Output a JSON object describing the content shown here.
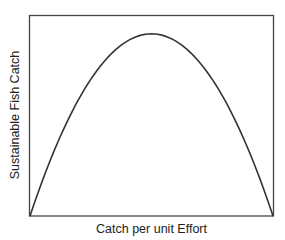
{
  "chart_data": {
    "type": "line",
    "title": "",
    "xlabel": "Catch per unit Effort",
    "ylabel": "Sustainable Fish Catch",
    "x": [
      0,
      0.1,
      0.2,
      0.3,
      0.4,
      0.5,
      0.6,
      0.7,
      0.8,
      0.9,
      1.0
    ],
    "series": [
      {
        "name": "Sustainable catch curve",
        "values": [
          0,
          0.36,
          0.64,
          0.84,
          0.96,
          1.0,
          0.96,
          0.84,
          0.64,
          0.36,
          0
        ]
      }
    ],
    "xlim": [
      0,
      1
    ],
    "ylim": [
      0,
      1.1
    ],
    "ticks": {
      "x": [],
      "y": []
    },
    "grid": false,
    "legend": null,
    "shape": "inverted parabola peaking at mid-effort"
  },
  "colors": {
    "line": "#333333",
    "frame": "#444444",
    "background": "#ffffff"
  }
}
